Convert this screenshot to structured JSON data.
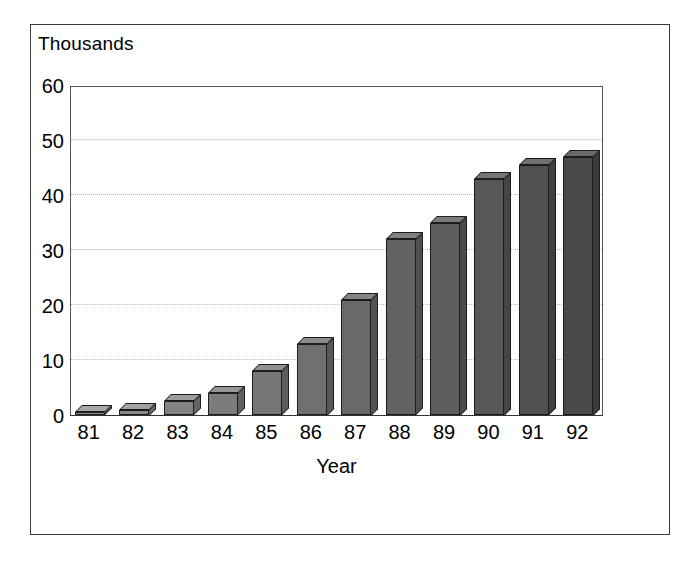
{
  "chart_data": {
    "type": "bar",
    "title": "",
    "subtitle": "",
    "unit_label": "Thousands",
    "xlabel": "Year",
    "ylabel": "",
    "categories": [
      "81",
      "82",
      "83",
      "84",
      "85",
      "86",
      "87",
      "88",
      "89",
      "90",
      "91",
      "92"
    ],
    "values": [
      0.5,
      1,
      2.5,
      4,
      8,
      13,
      21,
      32,
      35,
      43,
      45.5,
      47
    ],
    "ylim": [
      0,
      60
    ],
    "yticks": [
      0,
      10,
      20,
      30,
      40,
      50,
      60
    ],
    "ytick_labels": [
      "0",
      "10",
      "20",
      "30",
      "40",
      "50",
      "60"
    ],
    "grid": true,
    "grid_axis": "y",
    "legend": false,
    "legend_position": "none",
    "style": "3d-bar",
    "series": [
      {
        "name": "",
        "values": [
          0.5,
          1,
          2.5,
          4,
          8,
          13,
          21,
          32,
          35,
          43,
          45.5,
          47
        ]
      }
    ],
    "colors": {
      "bar_front_light": "#8f8f8f",
      "bar_front_dark": "#4a4a4a",
      "bar_side": "#6e6e6e",
      "bar_top": "#a8a8a8",
      "bar_outline": "#1c1c1c",
      "gridline": "#b9b9b9",
      "axis": "#555555",
      "frame": "#3a3a3a",
      "background": "#ffffff",
      "text": "#000000"
    }
  }
}
